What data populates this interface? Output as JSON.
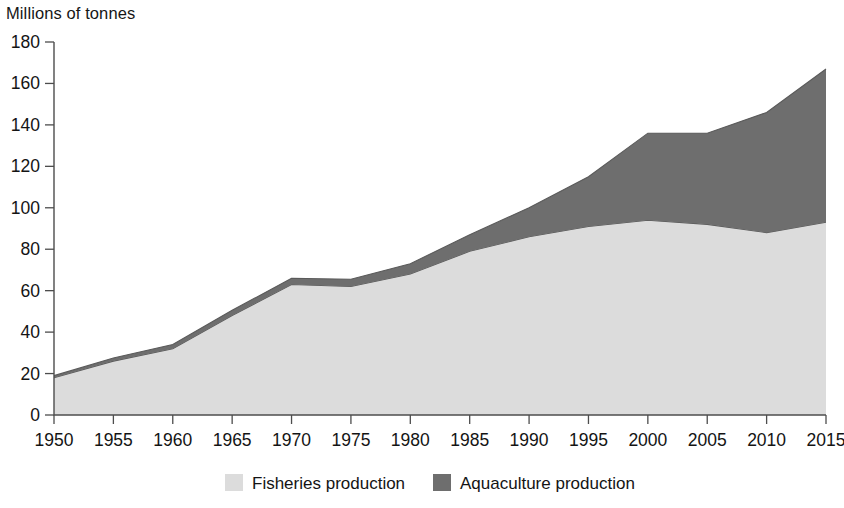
{
  "chart_data": {
    "type": "area",
    "stacked": true,
    "title": "Millions of tonnes",
    "subtitle": "",
    "xlabel": "",
    "ylabel": "Millions of tonnes",
    "x": [
      1950,
      1955,
      1960,
      1965,
      1970,
      1975,
      1980,
      1985,
      1990,
      1995,
      2000,
      2005,
      2010,
      2015
    ],
    "categories": [
      "1950",
      "1955",
      "1960",
      "1965",
      "1970",
      "1975",
      "1980",
      "1985",
      "1990",
      "1995",
      "2000",
      "2005",
      "2010",
      "2015"
    ],
    "series": [
      {
        "name": "Fisheries production",
        "color": "#dcdcdc",
        "values": [
          18,
          26,
          32,
          48,
          63,
          62,
          68,
          79,
          86,
          91,
          94,
          92,
          88,
          93
        ]
      },
      {
        "name": "Aquaculture production",
        "color": "#6e6e6e",
        "values": [
          1,
          1.5,
          2,
          2.5,
          3,
          3.5,
          5,
          8,
          14,
          24,
          42,
          44,
          58,
          74
        ]
      }
    ],
    "totals": [
      19,
      27.5,
      34,
      50.5,
      66,
      65.5,
      73,
      87,
      100,
      115,
      136,
      136,
      146,
      167
    ],
    "xlim": [
      1950,
      2015
    ],
    "ylim": [
      0,
      180
    ],
    "yticks": [
      "0",
      "20",
      "40",
      "60",
      "80",
      "100",
      "120",
      "140",
      "160",
      "180"
    ],
    "ytick_values": [
      0,
      20,
      40,
      60,
      80,
      100,
      120,
      140,
      160,
      180
    ],
    "xticks": [
      "1950",
      "1955",
      "1960",
      "1965",
      "1970",
      "1975",
      "1980",
      "1985",
      "1990",
      "1995",
      "2000",
      "2005",
      "2010",
      "2015"
    ],
    "grid": false,
    "legend_position": "bottom"
  },
  "legend": {
    "items": [
      {
        "label": "Fisheries production",
        "color": "#dcdcdc"
      },
      {
        "label": "Aquaculture production",
        "color": "#6e6e6e"
      }
    ]
  },
  "axes": {
    "y_axis_caption": "Millions of tonnes"
  }
}
